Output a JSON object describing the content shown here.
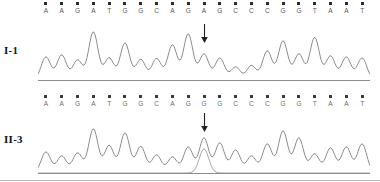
{
  "figure": {
    "type": "dna-sequencing-chromatogram",
    "panel_count": 2
  },
  "panels": [
    {
      "id": "I-1",
      "label": "I-1",
      "sequence": "AAGATGGCAGAGCCCGGTAAT",
      "bases": [
        "A",
        "A",
        "G",
        "A",
        "T",
        "G",
        "G",
        "C",
        "A",
        "G",
        "A",
        "G",
        "C",
        "C",
        "C",
        "G",
        "G",
        "T",
        "A",
        "A",
        "T"
      ],
      "variant_index": 10,
      "variant_base": "A",
      "genotype": "homozygous",
      "arrow": {
        "present": true,
        "target_base": "A",
        "direction": "down"
      },
      "peak_heights": [
        0.46,
        0.5,
        0.4,
        0.96,
        0.44,
        0.74,
        0.41,
        0.43,
        0.7,
        0.92,
        0.52,
        0.44,
        0.26,
        0.29,
        0.58,
        0.78,
        0.52,
        0.85,
        0.48,
        0.46,
        0.44
      ]
    },
    {
      "id": "II-3",
      "label": "II-3",
      "sequence": "AAGATGGCAGGGCCCGGTAAT",
      "bases": [
        "A",
        "A",
        "G",
        "A",
        "T",
        "G",
        "G",
        "C",
        "A",
        "G",
        "G",
        "G",
        "C",
        "C",
        "C",
        "G",
        "G",
        "T",
        "A",
        "A",
        "T"
      ],
      "variant_index": 10,
      "variant_base": "G",
      "genotype": "heterozygous",
      "arrow": {
        "present": true,
        "target_base": "G",
        "direction": "down"
      },
      "peak_heights": [
        0.42,
        0.34,
        0.4,
        0.88,
        0.55,
        0.8,
        0.53,
        0.36,
        0.32,
        0.52,
        0.7,
        0.6,
        0.46,
        0.34,
        0.58,
        0.84,
        0.7,
        0.38,
        0.5,
        0.52,
        0.58
      ],
      "secondary_peak_heights": [
        0,
        0,
        0,
        0,
        0,
        0,
        0,
        0,
        0,
        0,
        0.48,
        0,
        0,
        0,
        0,
        0,
        0,
        0,
        0,
        0,
        0
      ]
    }
  ],
  "colors": {
    "trace": "#6e6e6e",
    "trace_secondary": "#8f8f8f",
    "baseline": "#8e8e8e",
    "tick": "#2c2c2c",
    "letter": "#555555",
    "arrow": "#222222",
    "background": "#ffffff"
  },
  "chart_data": {
    "type": "line",
    "title": "",
    "xlabel": "",
    "ylabel": "",
    "grid": false,
    "legend_position": "none",
    "x": [
      "A",
      "A",
      "G",
      "A",
      "T",
      "G",
      "G",
      "C",
      "A",
      "G",
      "A/G",
      "G",
      "C",
      "C",
      "C",
      "G",
      "G",
      "T",
      "A",
      "A",
      "T"
    ],
    "series": [
      {
        "name": "I-1",
        "values": [
          0.46,
          0.5,
          0.4,
          0.96,
          0.44,
          0.74,
          0.41,
          0.43,
          0.7,
          0.92,
          0.52,
          0.44,
          0.26,
          0.29,
          0.58,
          0.78,
          0.52,
          0.85,
          0.48,
          0.46,
          0.44
        ]
      },
      {
        "name": "II-3",
        "values": [
          0.42,
          0.34,
          0.4,
          0.88,
          0.55,
          0.8,
          0.53,
          0.36,
          0.32,
          0.52,
          0.7,
          0.6,
          0.46,
          0.34,
          0.58,
          0.84,
          0.7,
          0.38,
          0.5,
          0.52,
          0.58
        ]
      },
      {
        "name": "II-3 secondary",
        "values": [
          0,
          0,
          0,
          0,
          0,
          0,
          0,
          0,
          0,
          0,
          0.48,
          0,
          0,
          0,
          0,
          0,
          0,
          0,
          0,
          0,
          0
        ]
      }
    ],
    "ylim": [
      0,
      1
    ]
  }
}
